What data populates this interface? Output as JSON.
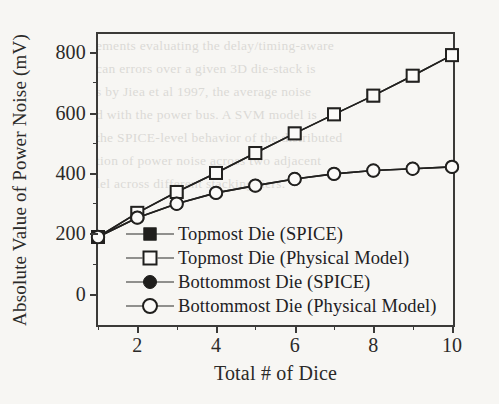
{
  "figure": {
    "background_color": "#f7f6f3",
    "ink_color": "#2b2a28"
  },
  "axis_titles": {
    "y": "Absolute Value of Power Noise (mV)",
    "x": "Total # of Dice"
  },
  "y_ticks": [
    "0",
    "200",
    "400",
    "600",
    "800"
  ],
  "x_ticks": [
    "2",
    "4",
    "6",
    "8",
    "10"
  ],
  "legend": {
    "items": [
      {
        "label": "Topmost Die (SPICE)",
        "marker": "square-filled"
      },
      {
        "label": "Topmost Die (Physical Model)",
        "marker": "square-open"
      },
      {
        "label": "Bottommost Die (SPICE)",
        "marker": "circle-filled"
      },
      {
        "label": "Bottommost Die (Physical Model)",
        "marker": "circle-open"
      }
    ]
  },
  "ghost_text": [
    {
      "text": "ements evaluating the delay/timing-aware",
      "x": 96,
      "y": 34
    },
    {
      "text": "can errors over a given 3D die-stack is",
      "x": 96,
      "y": 57
    },
    {
      "text": "s by Jiea et al 1997, the average noise",
      "x": 96,
      "y": 80
    },
    {
      "text": "d with the power bus. A SVM model is",
      "x": 96,
      "y": 103
    },
    {
      "text": "the SPICE-level behavior of the distributed",
      "x": 96,
      "y": 126
    },
    {
      "text": "tion of power noise across two adjacent",
      "x": 96,
      "y": 149
    },
    {
      "text": "lel across different stacking tiers.",
      "x": 96,
      "y": 172
    }
  ],
  "chart_data": {
    "type": "line",
    "title": "",
    "xlabel": "Total # of Dice",
    "ylabel": "Absolute Value of Power Noise (mV)",
    "xlim": [
      1,
      10
    ],
    "ylim": [
      -100,
      860
    ],
    "grid": false,
    "legend_position": "inside-lower-left",
    "x": [
      1,
      2,
      3,
      4,
      5,
      6,
      7,
      8,
      9,
      10
    ],
    "series": [
      {
        "name": "Topmost Die (SPICE)",
        "marker": "square-filled",
        "values": [
          188,
          268,
          337,
          400,
          466,
          531,
          594,
          656,
          722,
          790
        ]
      },
      {
        "name": "Topmost Die (Physical Model)",
        "marker": "square-open",
        "values": [
          188,
          268,
          337,
          400,
          466,
          531,
          594,
          656,
          722,
          790
        ]
      },
      {
        "name": "Bottommost Die (SPICE)",
        "marker": "circle-filled",
        "values": [
          188,
          252,
          298,
          334,
          358,
          380,
          397,
          408,
          414,
          420
        ]
      },
      {
        "name": "Bottommost Die (Physical Model)",
        "marker": "circle-open",
        "values": [
          188,
          252,
          298,
          334,
          358,
          380,
          397,
          408,
          414,
          420
        ]
      }
    ]
  }
}
